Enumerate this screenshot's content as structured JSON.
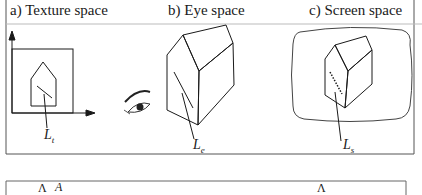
{
  "figure": {
    "panels": [
      {
        "id": "a",
        "title": "a) Texture space",
        "line_label": "L",
        "line_label_sub": "t"
      },
      {
        "id": "b",
        "title": "b) Eye space",
        "line_label": "L",
        "line_label_sub": "e"
      },
      {
        "id": "c",
        "title": "c) Screen space",
        "line_label": "L",
        "line_label_sub": "s"
      }
    ],
    "bottom_panel": {
      "glyphs": [
        "Λ",
        "A",
        "Λ"
      ]
    },
    "colors": {
      "stroke": "#1a1a1a",
      "frame": "#555555",
      "divider": "#bbbbbb",
      "background": "#ffffff"
    }
  }
}
